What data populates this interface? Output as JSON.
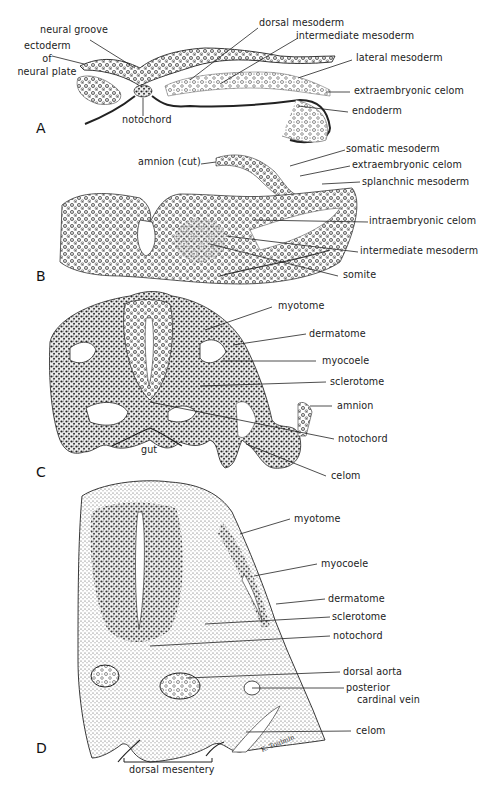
{
  "figure": {
    "panels": [
      {
        "letter": "A",
        "labels": {
          "neural_groove": "neural groove",
          "ectoderm_l1": "ectoderm",
          "ectoderm_l2": "of",
          "ectoderm_l3": "neural plate",
          "notochord": "notochord",
          "dorsal_mesoderm": "dorsal mesoderm",
          "intermediate_mesoderm": "intermediate mesoderm",
          "lateral_mesoderm": "lateral mesoderm",
          "extraembryonic_celom": "extraembryonic celom",
          "endoderm": "endoderm"
        }
      },
      {
        "letter": "B",
        "labels": {
          "amnion_cut": "amnion (cut)",
          "somatic_mesoderm": "somatic mesoderm",
          "extraembryonic_celom": "extraembryonic celom",
          "splanchnic_mesoderm": "splanchnic mesoderm",
          "intraembryonic_celom": "intraembryonic celom",
          "intermediate_mesoderm": "intermediate mesoderm",
          "somite": "somite"
        }
      },
      {
        "letter": "C",
        "labels": {
          "myotome": "myotome",
          "dermatome": "dermatome",
          "myocoele": "myocoele",
          "sclerotome": "sclerotome",
          "amnion": "amnion",
          "notochord": "notochord",
          "gut": "gut",
          "celom": "celom"
        }
      },
      {
        "letter": "D",
        "labels": {
          "myotome": "myotome",
          "myocoele": "myocoele",
          "dermatome": "dermatome",
          "sclerotome": "sclerotome",
          "notochord": "notochord",
          "dorsal_aorta": "dorsal aorta",
          "posterior_l1": "posterior",
          "posterior_l2": "cardinal vein",
          "celom": "celom",
          "dorsal_mesentery": "dorsal mesentery",
          "signature": "K. Toulmin"
        }
      }
    ]
  }
}
